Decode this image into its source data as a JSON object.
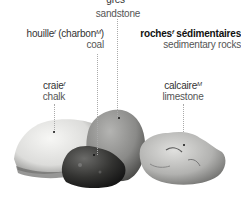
{
  "title": {
    "fr": "roches",
    "fr_gender": "f",
    "fr2": "sédimentaires",
    "en": "sedimentary rocks"
  },
  "labels": {
    "sandstone": {
      "fr": "grès",
      "fr_gender": "M",
      "en": "sandstone"
    },
    "coal": {
      "fr": "houille",
      "fr_gender": "f",
      "fr_alt": "(charbon",
      "fr_alt_gender": "M",
      "fr_alt_close": ")",
      "en": "coal"
    },
    "chalk": {
      "fr": "craie",
      "fr_gender": "f",
      "en": "chalk"
    },
    "limestone": {
      "fr": "calcaire",
      "fr_gender": "M",
      "en": "limestone"
    }
  },
  "colors": {
    "chalk": "#e9e9e7",
    "sandstone": "#8e8e8c",
    "coal": "#3a3a38",
    "limestone": "#bdbdbb",
    "leader": "#aaaaaa"
  }
}
